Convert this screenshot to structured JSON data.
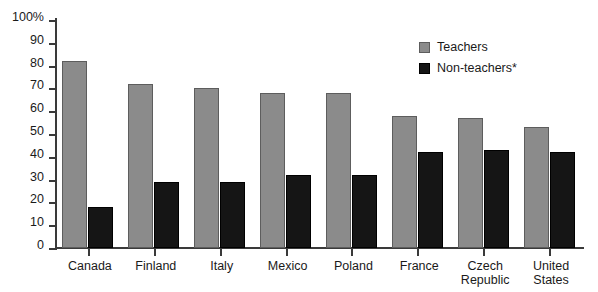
{
  "chart_data": {
    "type": "bar",
    "title": "",
    "subtitle": "",
    "xlabel": "",
    "ylabel": "",
    "ylim": [
      0,
      100
    ],
    "grid": false,
    "legend_position": "top-right",
    "y_ticks": [
      "0",
      "10",
      "20",
      "30",
      "40",
      "50",
      "60",
      "70",
      "80",
      "90",
      "100%"
    ],
    "y_tick_values": [
      0,
      10,
      20,
      30,
      40,
      50,
      60,
      70,
      80,
      90,
      100
    ],
    "categories": [
      "Canada",
      "Finland",
      "Italy",
      "Mexico",
      "Poland",
      "France",
      "Czech Republic",
      "United States"
    ],
    "category_lines": [
      [
        "Canada"
      ],
      [
        "Finland"
      ],
      [
        "Italy"
      ],
      [
        "Mexico"
      ],
      [
        "Poland"
      ],
      [
        "France"
      ],
      [
        "Czech",
        "Republic"
      ],
      [
        "United",
        "States"
      ]
    ],
    "series": [
      {
        "name": "Teachers",
        "color": "#8b8b8b",
        "values": [
          82,
          72,
          70,
          68,
          68,
          58,
          57,
          53
        ]
      },
      {
        "name": "Non-teachers*",
        "color": "#151515",
        "values": [
          18,
          29,
          29,
          32,
          32,
          42,
          43,
          42
        ]
      }
    ]
  },
  "legend": {
    "items": [
      {
        "label": "Teachers",
        "swatch": "teachers"
      },
      {
        "label": "Non-teachers*",
        "swatch": "nonteachers"
      }
    ]
  },
  "colors": {
    "teachers": "#8b8b8b",
    "nonteachers": "#151515",
    "axis": "#3a3a3a",
    "text": "#1a1a1a",
    "background": "#ffffff"
  }
}
